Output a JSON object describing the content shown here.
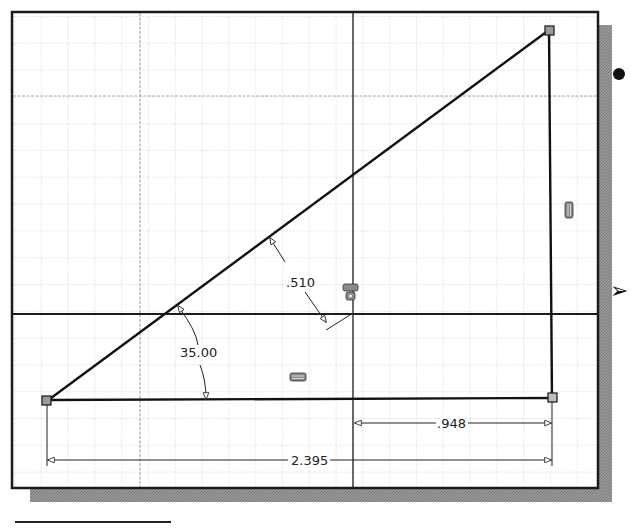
{
  "window": {
    "type": "cad-sketch-viewport",
    "background": "#ffffff",
    "frame_color": "#1a1a1a",
    "shadow_color": "#8c8c8c",
    "grid_minor_color": "#c8c8c8",
    "grid_major_color": "#a8a8a8"
  },
  "sketch": {
    "geometry": "right-triangle",
    "vertices": [
      {
        "name": "origin-left",
        "x": 47,
        "y": 401
      },
      {
        "name": "apex-top-right",
        "x": 549,
        "y": 30
      },
      {
        "name": "corner-bottom-right",
        "x": 552,
        "y": 398
      }
    ],
    "axes": {
      "horizontal_y": 314,
      "vertical_x": 353
    }
  },
  "dimensions": {
    "angle": {
      "label": "35.00",
      "type": "angular"
    },
    "offset": {
      "label": ".510",
      "type": "linear-aligned"
    },
    "partial_width": {
      "label": ".948",
      "type": "horizontal"
    },
    "total_width": {
      "label": "2.395",
      "type": "horizontal"
    }
  },
  "constraints": [
    {
      "name": "horizontal-constraint-icon",
      "location": "bottom-edge"
    },
    {
      "name": "vertical-constraint-icon",
      "location": "right-edge"
    },
    {
      "name": "coincident-constraint-icon",
      "location": "axis-intersection"
    }
  ],
  "side_markers": {
    "bullet": "•",
    "arrow": "➢"
  }
}
